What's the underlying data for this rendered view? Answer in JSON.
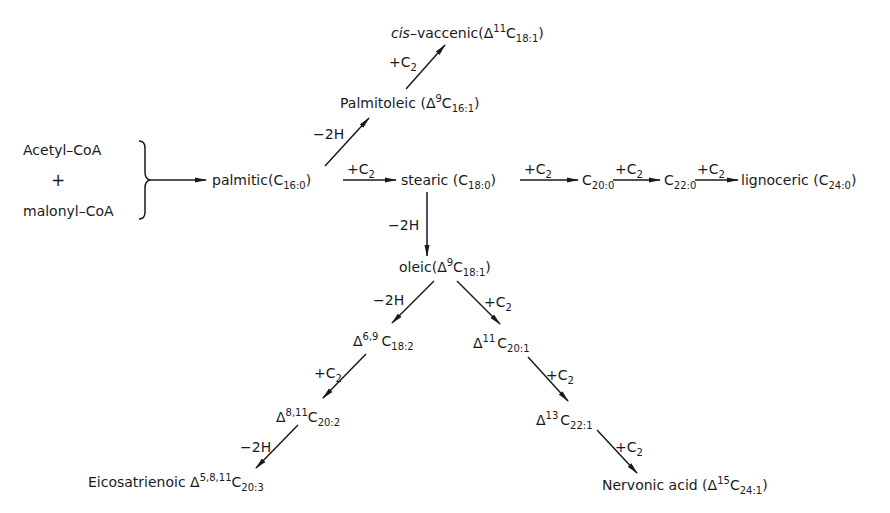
{
  "diagram": {
    "type": "biosynthesis-pathway",
    "colors": {
      "ink": "#1a1a1a",
      "background": "#ffffff"
    },
    "nodes": {
      "acetyl_coa": {
        "label": "Acetyl–CoA"
      },
      "plus": {
        "label": "+"
      },
      "malonyl_coa": {
        "label": "malonyl–CoA"
      },
      "palmitic": {
        "name": "palmitic",
        "formula_main": "C",
        "formula_sub": "16:0"
      },
      "palmitoleic": {
        "name": "Palmitoleic",
        "delta": "Δ",
        "delta_sup": "9",
        "formula_main": "C",
        "formula_sub": "16:1"
      },
      "cis_vaccenic": {
        "prefix": "cis",
        "name": "–vaccenic",
        "delta": "Δ",
        "delta_sup": "11",
        "formula_main": "C",
        "formula_sub": "18:1"
      },
      "stearic": {
        "name": "stearic",
        "formula_main": "C",
        "formula_sub": "18:0"
      },
      "c20_0": {
        "formula_main": "C",
        "formula_sub": "20:0"
      },
      "c22_0": {
        "formula_main": "C",
        "formula_sub": "22:0"
      },
      "lignoceric": {
        "name": "lignoceric",
        "formula_main": "C",
        "formula_sub": "24:0"
      },
      "oleic": {
        "name": "oleic",
        "delta": "Δ",
        "delta_sup": "9",
        "formula_main": "C",
        "formula_sub": "18:1"
      },
      "d69_c18_2": {
        "delta": "Δ",
        "delta_sup": "6,9",
        "formula_main": "C",
        "formula_sub": "18:2"
      },
      "d811_c20_2": {
        "delta": "Δ",
        "delta_sup": "8,11",
        "formula_main": "C",
        "formula_sub": "20:2"
      },
      "eicosatrienoic": {
        "name": "Eicosatrienoic",
        "delta": "Δ",
        "delta_sup": "5,8,11",
        "formula_main": "C",
        "formula_sub": "20:3"
      },
      "d11_c20_1": {
        "delta": "Δ",
        "delta_sup": "11",
        "formula_main": "C",
        "formula_sub": "20:1"
      },
      "d13_c22_1": {
        "delta": "Δ",
        "delta_sup": "13",
        "formula_main": "C",
        "formula_sub": "22:1"
      },
      "nervonic": {
        "name": "Nervonic  acid",
        "delta": "Δ",
        "delta_sup": "15",
        "formula_main": "C",
        "formula_sub": "24:1"
      }
    },
    "edge_labels": {
      "desaturation": "−2H",
      "elongation_main": "+C",
      "elongation_sub": "2"
    },
    "edges": [
      {
        "from": "acetyl_coa+malonyl_coa",
        "to": "palmitic",
        "label": ""
      },
      {
        "from": "palmitic",
        "to": "palmitoleic",
        "label": "−2H"
      },
      {
        "from": "palmitoleic",
        "to": "cis_vaccenic",
        "label": "+C2"
      },
      {
        "from": "palmitic",
        "to": "stearic",
        "label": "+C2"
      },
      {
        "from": "stearic",
        "to": "c20_0",
        "label": "+C2"
      },
      {
        "from": "c20_0",
        "to": "c22_0",
        "label": "+C2"
      },
      {
        "from": "c22_0",
        "to": "lignoceric",
        "label": "+C2"
      },
      {
        "from": "stearic",
        "to": "oleic",
        "label": "−2H"
      },
      {
        "from": "oleic",
        "to": "d69_c18_2",
        "label": "−2H"
      },
      {
        "from": "d69_c18_2",
        "to": "d811_c20_2",
        "label": "+C2"
      },
      {
        "from": "d811_c20_2",
        "to": "eicosatrienoic",
        "label": "−2H"
      },
      {
        "from": "oleic",
        "to": "d11_c20_1",
        "label": "+C2"
      },
      {
        "from": "d11_c20_1",
        "to": "d13_c22_1",
        "label": "+C2"
      },
      {
        "from": "d13_c22_1",
        "to": "nervonic",
        "label": "+C2"
      }
    ]
  }
}
